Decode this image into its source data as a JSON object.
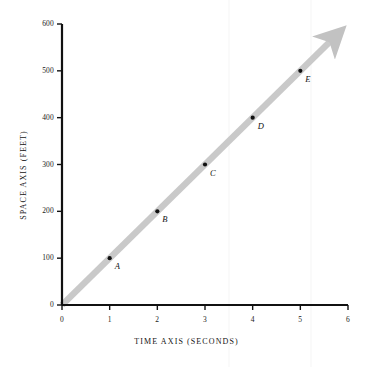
{
  "chart_data": {
    "type": "scatter",
    "title": "",
    "subtitle": "",
    "xlabel": "TIME AXIS   (SECONDS)",
    "ylabel": "SPACE AXIS (FEET)",
    "xlim": [
      0,
      6
    ],
    "ylim": [
      0,
      600
    ],
    "xticks": [
      "0",
      "1",
      "2",
      "3",
      "4",
      "5",
      "6"
    ],
    "xtick_values": [
      0,
      1,
      2,
      3,
      4,
      5,
      6
    ],
    "yticks": [
      "0",
      "100",
      "200",
      "300",
      "400",
      "500",
      "600"
    ],
    "ytick_values": [
      0,
      100,
      200,
      300,
      400,
      500,
      600
    ],
    "grid": false,
    "legend": null,
    "points": [
      {
        "label": "A",
        "x": 1,
        "y": 100
      },
      {
        "label": "B",
        "x": 2,
        "y": 200
      },
      {
        "label": "C",
        "x": 3,
        "y": 300
      },
      {
        "label": "D",
        "x": 4,
        "y": 400
      },
      {
        "label": "E",
        "x": 5,
        "y": 500
      }
    ],
    "series": [
      {
        "name": "trend-band",
        "kind": "line",
        "style": "thick gray band with arrowhead",
        "x": [
          0,
          5.7
        ],
        "values": [
          0,
          570
        ]
      }
    ],
    "annotations": []
  },
  "colors": {
    "axis": "#111111",
    "band": "#c9c9c9",
    "point": "#111111",
    "text": "#141414",
    "background": "#ffffff"
  },
  "axis_titles": {
    "x": "TIME AXIS   (SECONDS)",
    "y": "SPACE AXIS (FEET)"
  }
}
